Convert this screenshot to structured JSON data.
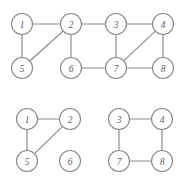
{
  "figure": {
    "width": 180,
    "height": 182,
    "background_color": "#ffffff",
    "stroke_color": "#8a8a8a",
    "label_color": "#5f5f5f",
    "node_fill": "#ffffff",
    "node_radius": 10.5
  },
  "chart_data": {
    "type": "diagram",
    "diagram_kind": "undirected-graph",
    "title": "",
    "panels": [
      {
        "id": "top-graph",
        "name": "original-graph",
        "caption": "",
        "nodes": [
          {
            "id": "1",
            "label": "1",
            "x": 22,
            "y": 24
          },
          {
            "id": "2",
            "label": "2",
            "x": 71,
            "y": 24
          },
          {
            "id": "3",
            "label": "3",
            "x": 116,
            "y": 24
          },
          {
            "id": "4",
            "label": "4",
            "x": 163,
            "y": 24
          },
          {
            "id": "5",
            "label": "5",
            "x": 22,
            "y": 68
          },
          {
            "id": "6",
            "label": "6",
            "x": 71,
            "y": 68
          },
          {
            "id": "7",
            "label": "7",
            "x": 116,
            "y": 68
          },
          {
            "id": "8",
            "label": "8",
            "x": 163,
            "y": 68
          }
        ],
        "edges": [
          {
            "from": "1",
            "to": "2"
          },
          {
            "from": "1",
            "to": "5"
          },
          {
            "from": "2",
            "to": "5"
          },
          {
            "from": "2",
            "to": "3"
          },
          {
            "from": "2",
            "to": "6"
          },
          {
            "from": "3",
            "to": "4"
          },
          {
            "from": "3",
            "to": "7"
          },
          {
            "from": "4",
            "to": "7"
          },
          {
            "from": "4",
            "to": "8"
          },
          {
            "from": "6",
            "to": "7"
          },
          {
            "from": "7",
            "to": "8"
          }
        ]
      },
      {
        "id": "bottom-left-graph",
        "name": "component-one",
        "caption": "",
        "nodes": [
          {
            "id": "1",
            "label": "1",
            "x": 27,
            "y": 119
          },
          {
            "id": "2",
            "label": "2",
            "x": 70,
            "y": 119
          },
          {
            "id": "5",
            "label": "5",
            "x": 27,
            "y": 161
          },
          {
            "id": "6",
            "label": "6",
            "x": 70,
            "y": 161
          }
        ],
        "edges": [
          {
            "from": "1",
            "to": "2"
          },
          {
            "from": "1",
            "to": "5"
          },
          {
            "from": "2",
            "to": "5"
          }
        ],
        "isolated_nodes": [
          "6"
        ]
      },
      {
        "id": "bottom-right-graph",
        "name": "component-two",
        "caption": "",
        "nodes": [
          {
            "id": "3",
            "label": "3",
            "x": 119,
            "y": 119
          },
          {
            "id": "4",
            "label": "4",
            "x": 162,
            "y": 119
          },
          {
            "id": "7",
            "label": "7",
            "x": 119,
            "y": 161
          },
          {
            "id": "8",
            "label": "8",
            "x": 162,
            "y": 161
          }
        ],
        "edges": [
          {
            "from": "3",
            "to": "4"
          },
          {
            "from": "3",
            "to": "7"
          },
          {
            "from": "4",
            "to": "8"
          },
          {
            "from": "7",
            "to": "8"
          }
        ],
        "isolated_nodes": []
      }
    ]
  }
}
